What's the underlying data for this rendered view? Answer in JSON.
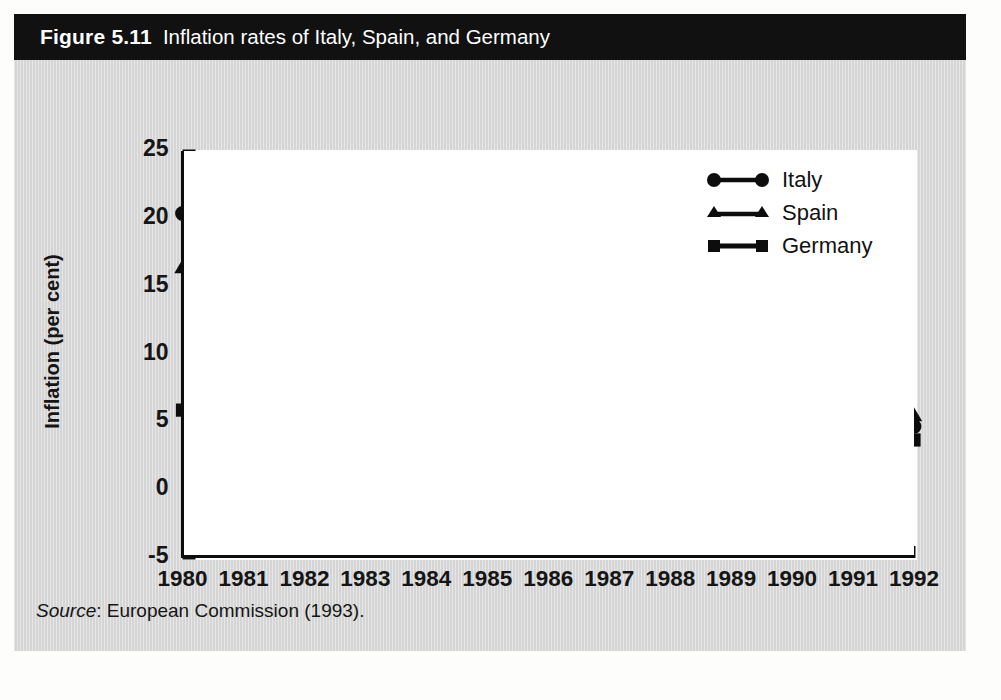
{
  "figure": {
    "label": "Figure 5.11",
    "title": "Inflation rates of Italy, Spain, and Germany",
    "source_word": "Source",
    "source_text": ": European Commission (1993).",
    "panel_color": "#d9d9d9",
    "title_bar_color": "#111111",
    "ink_color": "#0d0d0d"
  },
  "legend": {
    "position": "top-right",
    "items": [
      {
        "label": "Italy",
        "marker": "circle-marker"
      },
      {
        "label": "Spain",
        "marker": "triangle-marker"
      },
      {
        "label": "Germany",
        "marker": "square-marker"
      }
    ]
  },
  "chart_data": {
    "type": "line",
    "title": "Inflation rates of Italy, Spain, and Germany",
    "xlabel": "",
    "ylabel": "Inflation (per cent)",
    "grid": false,
    "legend_position": "top-right",
    "categories": [
      "1980",
      "1981",
      "1982",
      "1983",
      "1984",
      "1985",
      "1986",
      "1987",
      "1988",
      "1989",
      "1990",
      "1991",
      "1992"
    ],
    "x": [
      1980,
      1981,
      1982,
      1983,
      1984,
      1985,
      1986,
      1987,
      1988,
      1989,
      1990,
      1991,
      1992
    ],
    "xlim": [
      1980,
      1992
    ],
    "ylim": [
      -5,
      25
    ],
    "yticks": [
      -5,
      0,
      5,
      10,
      15,
      20,
      25
    ],
    "ytick_labels": [
      "-5",
      "0",
      "5",
      "10",
      "15",
      "20",
      "25"
    ],
    "series": [
      {
        "name": "Italy",
        "marker": "circle",
        "values": [
          20.4,
          17.9,
          16.9,
          14.5,
          11.8,
          8.7,
          5.9,
          5.1,
          5.3,
          6.2,
          5.6,
          6.3,
          4.7
        ]
      },
      {
        "name": "Spain",
        "marker": "triangle",
        "values": [
          16.4,
          14.1,
          14.3,
          12.0,
          10.6,
          7.9,
          8.9,
          5.1,
          4.5,
          6.1,
          5.9,
          5.7,
          5.5
        ]
      },
      {
        "name": "Germany",
        "marker": "square",
        "values": [
          5.9,
          6.2,
          4.9,
          3.3,
          2.5,
          2.0,
          -0.5,
          0.5,
          1.1,
          2.9,
          2.3,
          3.5,
          3.7
        ]
      }
    ]
  }
}
